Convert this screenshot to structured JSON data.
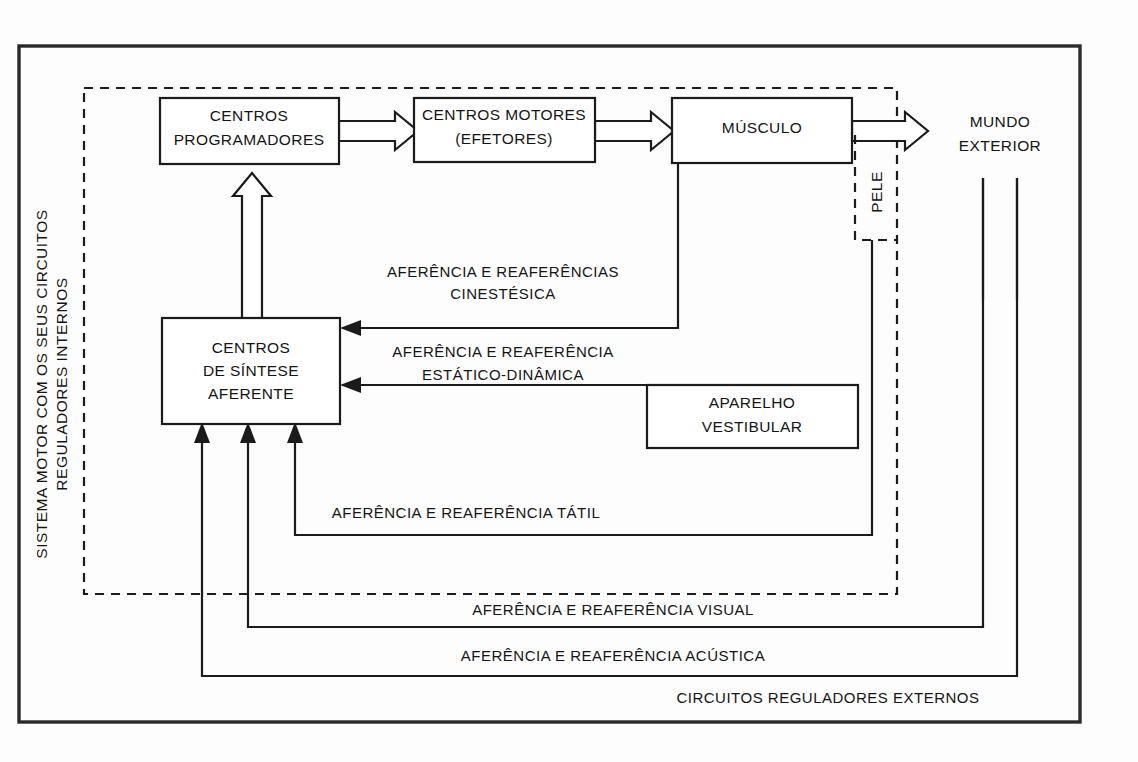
{
  "figure": {
    "title_vertical": "SISTEMA MOTOR COM OS SEUS CIRCUITOS REGULADORES INTERNOS",
    "external_label": "CIRCUITOS REGULADORES EXTERNOS",
    "outside_world": {
      "line1": "MUNDO",
      "line2": "EXTERIOR"
    },
    "skin_label": "PELE"
  },
  "boxes": [
    {
      "id": "centros-programadores",
      "line1": "CENTROS",
      "line2": "PROGRAMADORES"
    },
    {
      "id": "centros-motores",
      "line1": "CENTROS MOTORES",
      "line2": "(EFETORES)"
    },
    {
      "id": "musculo",
      "line1": "MÚSCULO",
      "line2": ""
    },
    {
      "id": "centros-sintese-aferente",
      "line1": "CENTROS",
      "line2": "DE SÍNTESE",
      "line3": "AFERENTE"
    },
    {
      "id": "aparelho-vestibular",
      "line1": "APARELHO",
      "line2": "VESTIBULAR"
    }
  ],
  "link_labels": {
    "cinestesica_l1": "AFERÊNCIA E REAFERÊNCIAS",
    "cinestesica_l2": "CINESTÉSICA",
    "estatico_l1": "AFERÊNCIA E REAFERÊNCIA",
    "estatico_l2": "ESTÁTICO-DINÂMICA",
    "tatil": "AFERÊNCIA E REAFERÊNCIA TÁTIL",
    "visual": "AFERÊNCIA E REAFERÊNCIA VISUAL",
    "acustica": "AFERÊNCIA E REAFERÊNCIA ACÚSTICA"
  },
  "colors": {
    "ink": "#1b1b1b",
    "paper": "#fdfdfd",
    "frame": "#2a2a2a"
  }
}
